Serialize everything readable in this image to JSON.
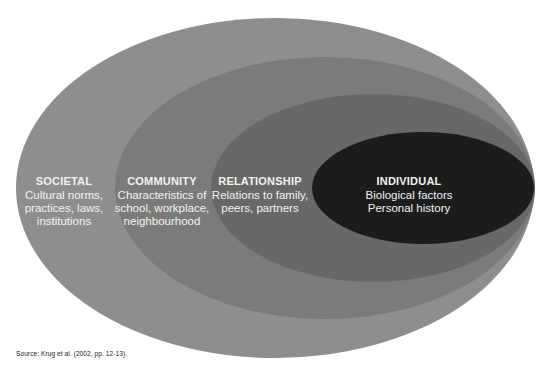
{
  "diagram": {
    "type": "nested-ellipses",
    "levels": [
      {
        "id": "societal",
        "title": "SOCIETAL",
        "lines": [
          "Cultural norms,",
          "practices, laws,",
          "institutions"
        ],
        "color": "#8e8e8e"
      },
      {
        "id": "community",
        "title": "COMMUNITY",
        "lines": [
          "Characteristics of",
          "school, workplace,",
          "neighbourhood"
        ],
        "color": "#7b7b7b"
      },
      {
        "id": "relationship",
        "title": "RELATIONSHIP",
        "lines": [
          "Relations to family,",
          "peers, partners"
        ],
        "color": "#686868"
      },
      {
        "id": "individual",
        "title": "INDIVIDUAL",
        "lines": [
          "Biological factors",
          "Personal history"
        ],
        "color": "#1c1c1c"
      }
    ],
    "text_color": "#f2f2f2"
  },
  "source": {
    "text": "Source: Krug et al. (2002, pp. 12-13)."
  }
}
